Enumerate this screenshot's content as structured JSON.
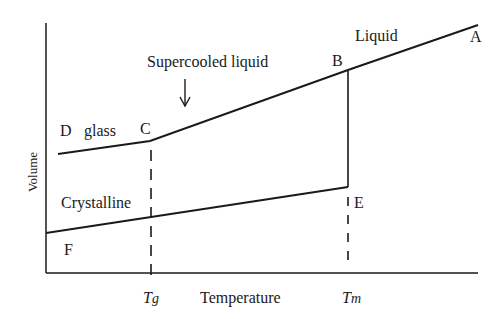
{
  "diagram": {
    "type": "volume-temperature diagram",
    "axes": {
      "x_label": "Temperature",
      "y_label": "Volume",
      "x_ticks": [
        {
          "label_main": "T",
          "label_sub": "g",
          "position": "glass transition temperature"
        },
        {
          "label_main": "T",
          "label_sub": "m",
          "position": "melting temperature"
        }
      ]
    },
    "points": {
      "A": "A",
      "B": "B",
      "C": "C",
      "D": "D",
      "E": "E",
      "F": "F"
    },
    "region_labels": {
      "liquid": "Liquid",
      "supercooled": "Supercooled liquid",
      "glass": "glass",
      "crystalline": "Crystalline"
    },
    "paths": [
      {
        "name": "liquid",
        "from": "B",
        "to": "A"
      },
      {
        "name": "supercooled-liquid",
        "from": "C",
        "to": "B"
      },
      {
        "name": "glass",
        "from": "D",
        "to": "C"
      },
      {
        "name": "crystallization-drop",
        "from": "B",
        "to": "E"
      },
      {
        "name": "crystalline",
        "from": "F",
        "to": "E"
      }
    ],
    "colors": {
      "line": "#1a1a1a",
      "background": "#ffffff"
    }
  }
}
